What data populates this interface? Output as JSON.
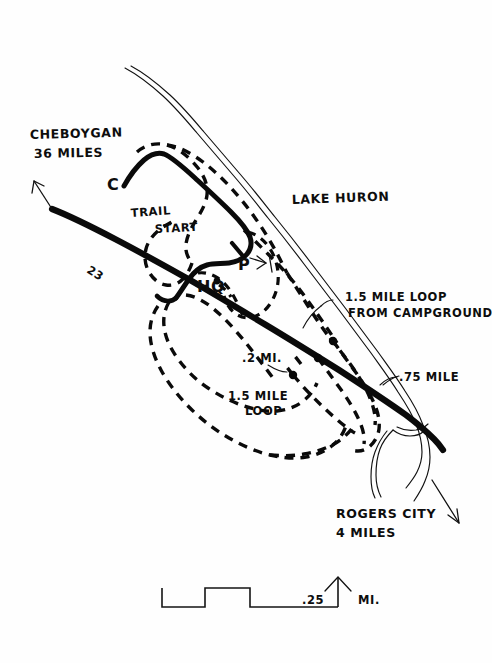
{
  "map": {
    "title": "Hoeft State Park Trail Map",
    "background_color": "#fefefe",
    "ink_color": "#0a0a0a",
    "labels": {
      "cheboygan_city": "CHEBOYGAN",
      "cheboygan_distance": "36 MILES",
      "rogers_city": "ROGERS CITY",
      "rogers_distance": "4 MILES",
      "lake": "LAKE HURON",
      "highway": "23",
      "campground": "C",
      "headquarters": "HQ",
      "parking": "P",
      "trail_start_line1": "TRAIL",
      "trail_start_line2": "START",
      "loop_campground_line1": "1.5 MILE LOOP",
      "loop_campground_line2": "FROM CAMPGROUND",
      "loop_west_line1": "1.5 MILE",
      "loop_west_line2": "LOOP",
      "spur_short": ".2 MI.",
      "loop_quarter": ".75 MILE"
    },
    "scale": {
      "value": ".25",
      "unit": "MI.",
      "north_arrow": "north-arrow"
    },
    "legend_features": [
      "highway-23",
      "lake-huron-shoreline",
      "campground-road",
      "hiking-trails-dashed",
      "trail-junction-markers"
    ]
  }
}
